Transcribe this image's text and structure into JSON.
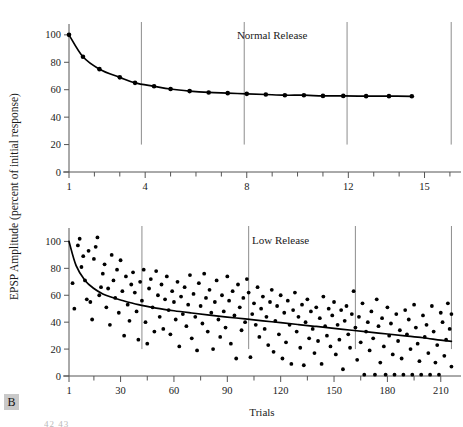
{
  "figure": {
    "panel_label": "B",
    "bottom_fragment": "42  43",
    "y_axis_label": "EPSP Amplitude (percent of initial response)",
    "x_axis_label": "Trials"
  },
  "chart_data": [
    {
      "id": "normal-release",
      "type": "line",
      "title": "Normal Release",
      "xlabel": "",
      "ylabel": "EPSP Amplitude (percent of initial response)",
      "xlim": [
        1,
        16.2
      ],
      "ylim": [
        0,
        105
      ],
      "grid": false,
      "legend": "none",
      "xticks_major": [
        1,
        4,
        8,
        12,
        15
      ],
      "xticks_minor": [
        2,
        3,
        5,
        6,
        7,
        9,
        10,
        11,
        13,
        14,
        16
      ],
      "yticks": [
        0,
        20,
        40,
        60,
        80,
        100
      ],
      "separator_lines_x": [
        3.85,
        7.9,
        11.95,
        16.05
      ],
      "annotation": {
        "text": "Normal Release",
        "x": 9.0,
        "y": 97
      },
      "x": [
        1,
        1.55,
        2.2,
        3.0,
        3.6,
        4.35,
        5.0,
        5.75,
        6.5,
        7.25,
        8.0,
        8.75,
        9.5,
        10.25,
        11.0,
        11.8,
        12.7,
        13.6,
        14.5
      ],
      "values": [
        100,
        84,
        75,
        69,
        65,
        62.5,
        60.5,
        59,
        58,
        57.5,
        57,
        56.5,
        56,
        56,
        55.5,
        55.5,
        55.3,
        55.3,
        55.2
      ]
    },
    {
      "id": "low-release",
      "type": "scatter",
      "title": "Low Release",
      "xlabel": "Trials",
      "ylabel": "EPSP Amplitude (percent of initial response)",
      "xlim": [
        1,
        218
      ],
      "ylim": [
        0,
        107
      ],
      "grid": false,
      "legend": "none",
      "xticks_major": [
        1,
        30,
        60,
        90,
        120,
        150,
        180,
        210
      ],
      "xticks_minor": [
        15,
        45,
        75,
        105,
        135,
        165,
        195
      ],
      "yticks": [
        0,
        20,
        40,
        60,
        80,
        100
      ],
      "separator_lines_x": [
        42,
        102,
        162,
        216
      ],
      "annotation": {
        "text": "Low Release",
        "x": 120,
        "y": 98
      },
      "fit_curve": {
        "name": "running mean",
        "x": [
          1,
          5,
          10,
          15,
          20,
          25,
          30,
          40,
          50,
          60,
          70,
          80,
          90,
          100,
          110,
          120,
          130,
          140,
          150,
          160,
          170,
          180,
          190,
          200,
          210,
          216
        ],
        "y": [
          100,
          82,
          71,
          65,
          61,
          58.5,
          56.5,
          53,
          50.5,
          48.5,
          46.8,
          45.2,
          43.8,
          42.4,
          41.0,
          39.6,
          38.2,
          36.8,
          35.4,
          34.0,
          32.6,
          31.2,
          29.8,
          28.4,
          26.6,
          25.8
        ]
      },
      "points": [
        [
          3,
          69
        ],
        [
          4,
          50
        ],
        [
          6,
          97
        ],
        [
          7,
          102
        ],
        [
          8,
          81
        ],
        [
          9,
          89
        ],
        [
          10,
          71
        ],
        [
          11,
          57
        ],
        [
          12,
          93
        ],
        [
          13,
          55
        ],
        [
          14,
          42
        ],
        [
          15,
          87
        ],
        [
          16,
          96
        ],
        [
          17,
          103
        ],
        [
          18,
          60
        ],
        [
          19,
          66
        ],
        [
          20,
          76
        ],
        [
          21,
          83
        ],
        [
          22,
          51
        ],
        [
          23,
          65
        ],
        [
          24,
          38
        ],
        [
          25,
          90
        ],
        [
          26,
          71
        ],
        [
          27,
          58
        ],
        [
          28,
          79
        ],
        [
          29,
          47
        ],
        [
          30,
          86
        ],
        [
          31,
          63
        ],
        [
          32,
          30
        ],
        [
          33,
          74
        ],
        [
          34,
          53
        ],
        [
          35,
          41
        ],
        [
          36,
          68
        ],
        [
          37,
          77
        ],
        [
          38,
          62
        ],
        [
          39,
          48
        ],
        [
          40,
          27
        ],
        [
          41,
          70
        ],
        [
          42,
          56
        ],
        [
          43,
          79
        ],
        [
          44,
          40
        ],
        [
          45,
          24
        ],
        [
          46,
          65
        ],
        [
          47,
          72
        ],
        [
          48,
          51
        ],
        [
          49,
          33
        ],
        [
          50,
          78
        ],
        [
          51,
          60
        ],
        [
          52,
          44
        ],
        [
          53,
          68
        ],
        [
          54,
          35
        ],
        [
          55,
          57
        ],
        [
          56,
          74
        ],
        [
          57,
          49
        ],
        [
          58,
          31
        ],
        [
          59,
          63
        ],
        [
          60,
          55
        ],
        [
          61,
          42
        ],
        [
          62,
          70
        ],
        [
          63,
          22
        ],
        [
          64,
          59
        ],
        [
          65,
          46
        ],
        [
          66,
          66
        ],
        [
          67,
          37
        ],
        [
          68,
          53
        ],
        [
          69,
          75
        ],
        [
          70,
          28
        ],
        [
          71,
          61
        ],
        [
          72,
          44
        ],
        [
          73,
          19
        ],
        [
          74,
          69
        ],
        [
          75,
          52
        ],
        [
          76,
          39
        ],
        [
          77,
          76
        ],
        [
          78,
          58
        ],
        [
          79,
          33
        ],
        [
          80,
          64
        ],
        [
          81,
          47
        ],
        [
          82,
          20
        ],
        [
          83,
          55
        ],
        [
          84,
          71
        ],
        [
          85,
          42
        ],
        [
          86,
          29
        ],
        [
          87,
          60
        ],
        [
          88,
          48
        ],
        [
          89,
          36
        ],
        [
          90,
          74
        ],
        [
          91,
          56
        ],
        [
          92,
          24
        ],
        [
          93,
          63
        ],
        [
          94,
          45
        ],
        [
          95,
          13
        ],
        [
          96,
          68
        ],
        [
          97,
          51
        ],
        [
          98,
          34
        ],
        [
          99,
          58
        ],
        [
          100,
          40
        ],
        [
          101,
          72
        ],
        [
          102,
          62
        ],
        [
          103,
          14
        ],
        [
          104,
          46
        ],
        [
          105,
          54
        ],
        [
          106,
          38
        ],
        [
          107,
          66
        ],
        [
          108,
          29
        ],
        [
          109,
          50
        ],
        [
          110,
          59
        ],
        [
          111,
          35
        ],
        [
          112,
          44
        ],
        [
          113,
          23
        ],
        [
          114,
          55
        ],
        [
          115,
          64
        ],
        [
          116,
          18
        ],
        [
          117,
          41
        ],
        [
          118,
          52
        ],
        [
          119,
          31
        ],
        [
          120,
          60
        ],
        [
          121,
          13
        ],
        [
          122,
          47
        ],
        [
          123,
          25
        ],
        [
          124,
          56
        ],
        [
          125,
          38
        ],
        [
          126,
          9
        ],
        [
          127,
          49
        ],
        [
          128,
          62
        ],
        [
          129,
          33
        ],
        [
          130,
          44
        ],
        [
          131,
          21
        ],
        [
          132,
          53
        ],
        [
          133,
          8
        ],
        [
          134,
          40
        ],
        [
          135,
          57
        ],
        [
          136,
          28
        ],
        [
          137,
          48
        ],
        [
          138,
          35
        ],
        [
          139,
          17
        ],
        [
          140,
          51
        ],
        [
          141,
          26
        ],
        [
          142,
          43
        ],
        [
          143,
          9
        ],
        [
          144,
          59
        ],
        [
          145,
          37
        ],
        [
          146,
          30
        ],
        [
          147,
          50
        ],
        [
          148,
          22
        ],
        [
          149,
          45
        ],
        [
          150,
          55
        ],
        [
          151,
          16
        ],
        [
          152,
          38
        ],
        [
          153,
          27
        ],
        [
          154,
          49
        ],
        [
          155,
          5
        ],
        [
          156,
          41
        ],
        [
          157,
          52
        ],
        [
          158,
          31
        ],
        [
          159,
          21
        ],
        [
          160,
          46
        ],
        [
          161,
          63
        ],
        [
          162,
          36
        ],
        [
          163,
          12
        ],
        [
          164,
          44
        ],
        [
          165,
          25
        ],
        [
          166,
          54
        ],
        [
          167,
          1
        ],
        [
          168,
          33
        ],
        [
          169,
          40
        ],
        [
          170,
          19
        ],
        [
          171,
          48
        ],
        [
          172,
          28
        ],
        [
          173,
          1
        ],
        [
          174,
          57
        ],
        [
          175,
          37
        ],
        [
          176,
          10
        ],
        [
          177,
          43
        ],
        [
          178,
          22
        ],
        [
          179,
          1
        ],
        [
          180,
          51
        ],
        [
          181,
          30
        ],
        [
          182,
          39
        ],
        [
          183,
          16
        ],
        [
          184,
          1
        ],
        [
          185,
          46
        ],
        [
          186,
          26
        ],
        [
          187,
          34
        ],
        [
          188,
          13
        ],
        [
          189,
          1
        ],
        [
          190,
          49
        ],
        [
          191,
          31
        ],
        [
          192,
          42
        ],
        [
          193,
          20
        ],
        [
          194,
          1
        ],
        [
          195,
          53
        ],
        [
          196,
          36
        ],
        [
          197,
          24
        ],
        [
          198,
          11
        ],
        [
          199,
          1
        ],
        [
          200,
          45
        ],
        [
          201,
          29
        ],
        [
          202,
          38
        ],
        [
          203,
          17
        ],
        [
          204,
          1
        ],
        [
          205,
          52
        ],
        [
          206,
          33
        ],
        [
          207,
          10
        ],
        [
          208,
          23
        ],
        [
          209,
          1
        ],
        [
          210,
          47
        ],
        [
          211,
          40
        ],
        [
          212,
          15
        ],
        [
          213,
          27
        ],
        [
          214,
          54
        ],
        [
          215,
          35
        ],
        [
          216,
          7
        ],
        [
          216,
          46
        ]
      ]
    }
  ]
}
